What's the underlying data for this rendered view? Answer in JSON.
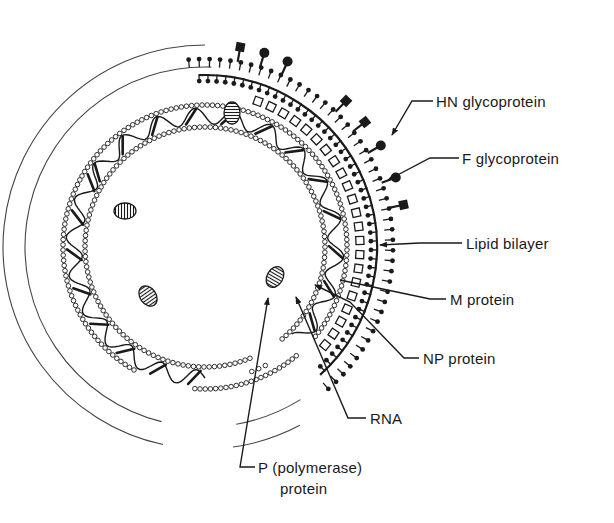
{
  "diagram": {
    "colors": {
      "ink": "#1a1a1a",
      "faint_arc": "#444444",
      "background": "#ffffff"
    },
    "labels": {
      "hn": "HN glycoprotein",
      "f": "F glycoprotein",
      "lipid": "Lipid bilayer",
      "m": "M protein",
      "np": "NP protein",
      "rna": "RNA",
      "p_line1": "P (polymerase)",
      "p_line2": "protein"
    },
    "components": [
      {
        "id": "hn",
        "name": "HN glycoprotein",
        "shape": "square-headed spike"
      },
      {
        "id": "f",
        "name": "F glycoprotein",
        "shape": "round-headed spike"
      },
      {
        "id": "lipid",
        "name": "Lipid bilayer",
        "shape": "double row of lollipop lipids"
      },
      {
        "id": "m",
        "name": "M protein",
        "shape": "row of open squares"
      },
      {
        "id": "np",
        "name": "NP protein",
        "shape": "beaded double ring"
      },
      {
        "id": "rna",
        "name": "RNA",
        "shape": "helical strand between beads"
      },
      {
        "id": "p",
        "name": "P (polymerase) protein",
        "shape": "hatched ovals"
      }
    ]
  }
}
